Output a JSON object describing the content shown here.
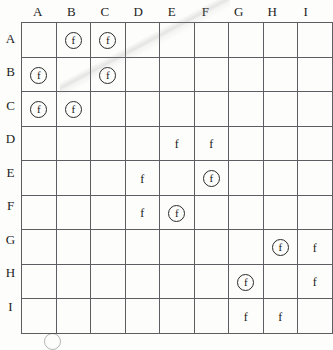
{
  "figure": {
    "name": "lettered-grid-chart",
    "columns": [
      "A",
      "B",
      "C",
      "D",
      "E",
      "F",
      "G",
      "H",
      "I"
    ],
    "rows": [
      "A",
      "B",
      "C",
      "D",
      "E",
      "F",
      "G",
      "H",
      "I"
    ],
    "mark_glyph": "f",
    "mark_types": {
      "circled": "circled-f",
      "plain": "plain-f",
      "empty": ""
    },
    "grid_border_color": "#5d5d62",
    "text_color": "#1c1c1c",
    "paper_color": "#fdfdfb"
  },
  "chart_data": {
    "type": "table",
    "title": "",
    "xlabel": "",
    "ylabel": "",
    "categories": [
      "A",
      "B",
      "C",
      "D",
      "E",
      "F",
      "G",
      "H",
      "I"
    ],
    "row_categories": [
      "A",
      "B",
      "C",
      "D",
      "E",
      "F",
      "G",
      "H",
      "I"
    ],
    "legend": [
      "circled-f",
      "plain-f"
    ],
    "cells": [
      [
        "",
        "circled",
        "circled",
        "",
        "",
        "",
        "",
        "",
        ""
      ],
      [
        "circled",
        "",
        "circled",
        "",
        "",
        "",
        "",
        "",
        ""
      ],
      [
        "circled",
        "circled",
        "",
        "",
        "",
        "",
        "",
        "",
        ""
      ],
      [
        "",
        "",
        "",
        "",
        "plain",
        "plain",
        "",
        "",
        ""
      ],
      [
        "",
        "",
        "",
        "plain",
        "",
        "circled",
        "",
        "",
        ""
      ],
      [
        "",
        "",
        "",
        "plain",
        "circled",
        "",
        "",
        "",
        ""
      ],
      [
        "",
        "",
        "",
        "",
        "",
        "",
        "",
        "circled",
        "plain"
      ],
      [
        "",
        "",
        "",
        "",
        "",
        "",
        "circled",
        "",
        "plain"
      ],
      [
        "",
        "",
        "",
        "",
        "",
        "",
        "plain",
        "plain",
        ""
      ]
    ]
  },
  "legend": {
    "clipped_symbol": "circled-f"
  }
}
